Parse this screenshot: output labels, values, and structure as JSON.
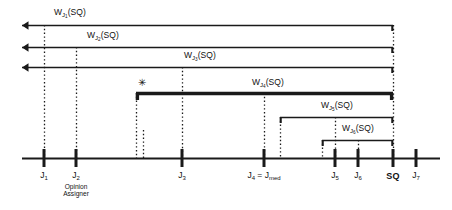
{
  "figure": {
    "type": "timeline-interval-diagram",
    "background": "#ffffff",
    "ink": "#1a1a1a",
    "axis": {
      "y": 158,
      "x_start": 22,
      "x_end": 440,
      "ticks": [
        {
          "id": "J1",
          "x": 44,
          "label": "J",
          "sub": "1",
          "sublabel": "",
          "bold": false
        },
        {
          "id": "J2",
          "x": 76,
          "label": "J",
          "sub": "2",
          "sublabel": "Opinion\nAssigner",
          "bold": false
        },
        {
          "id": "J3",
          "x": 182,
          "label": "J",
          "sub": "3",
          "sublabel": "",
          "bold": false
        },
        {
          "id": "J4",
          "x": 264,
          "label": "J",
          "sub": "4",
          "sublabel": "",
          "bold": false,
          "label_full": "J4 = Jmed"
        },
        {
          "id": "J5",
          "x": 335,
          "label": "J",
          "sub": "5",
          "sublabel": "",
          "bold": false
        },
        {
          "id": "J6",
          "x": 358,
          "label": "J",
          "sub": "6",
          "sublabel": "",
          "bold": false
        },
        {
          "id": "SQ",
          "x": 393,
          "label": "SQ",
          "sub": "",
          "sublabel": "",
          "bold": true
        },
        {
          "id": "J7",
          "x": 416,
          "label": "J",
          "sub": "7",
          "sublabel": "",
          "bold": false
        }
      ]
    },
    "tick_labels": {
      "J1": "J",
      "J1_sub": "1",
      "J2": "J",
      "J2_sub": "2",
      "J2_note_line1": "Opinion",
      "J2_note_line2": "Assigner",
      "J3": "J",
      "J3_sub": "3",
      "J4": "J",
      "J4_sub": "4",
      "J4_eq": " = J",
      "J4_med_sub": "med",
      "J5": "J",
      "J5_sub": "5",
      "J6": "J",
      "J6_sub": "6",
      "SQ": "SQ",
      "J7": "J",
      "J7_sub": "7"
    },
    "intervals": [
      {
        "id": "WJ1",
        "label_main": "W",
        "label_sub": "J",
        "label_subsub": "1",
        "label_tail": "(SQ)",
        "label_x": 70,
        "label_y": 8,
        "y": 25,
        "left_x": 22,
        "right_x": 393,
        "left_end": "arrow",
        "right_end": "bar",
        "thick": false,
        "anchor_x": 44,
        "star": false
      },
      {
        "id": "WJ2",
        "label_main": "W",
        "label_sub": "J",
        "label_subsub": "2",
        "label_tail": "(SQ)",
        "label_x": 103,
        "label_y": 31,
        "y": 47,
        "left_x": 22,
        "right_x": 393,
        "left_end": "arrow",
        "right_end": "bar",
        "thick": false,
        "anchor_x": 76,
        "star": false
      },
      {
        "id": "WJ3",
        "label_main": "W",
        "label_sub": "J",
        "label_subsub": "3",
        "label_tail": "(SQ)",
        "label_x": 200,
        "label_y": 51,
        "y": 67,
        "left_x": 22,
        "right_x": 393,
        "left_end": "arrow",
        "right_end": "bar",
        "thick": false,
        "anchor_x": 182,
        "star": false
      },
      {
        "id": "WJ4",
        "label_main": "W",
        "label_sub": "J",
        "label_subsub": "4",
        "label_tail": "(SQ)",
        "label_x": 268,
        "label_y": 78,
        "y": 93,
        "left_x": 136,
        "right_x": 393,
        "left_end": "bar",
        "right_end": "bar",
        "thick": true,
        "anchor_x": 264,
        "star": true,
        "star_x": 138,
        "star_y": 78
      },
      {
        "id": "WJ5",
        "label_main": "W",
        "label_sub": "J",
        "label_subsub": "5",
        "label_tail": "(SQ)",
        "label_x": 337,
        "label_y": 101,
        "y": 117,
        "left_x": 280,
        "right_x": 393,
        "left_end": "bar",
        "right_end": "bar",
        "thick": false,
        "anchor_x": 335,
        "star": false
      },
      {
        "id": "WJ6",
        "label_main": "W",
        "label_sub": "J",
        "label_subsub": "6",
        "label_tail": "(SQ)",
        "label_x": 358,
        "label_y": 124,
        "y": 140,
        "left_x": 322,
        "right_x": 393,
        "left_end": "bar",
        "right_end": "bar",
        "thick": false,
        "anchor_x": 358,
        "star": false
      }
    ],
    "dotted_verticals": [
      {
        "x": 44,
        "y_top": 25,
        "y_bottom": 158
      },
      {
        "x": 76,
        "y_top": 47,
        "y_bottom": 158
      },
      {
        "x": 136,
        "y_top": 93,
        "y_bottom": 158
      },
      {
        "x": 143,
        "y_top": 130,
        "y_bottom": 158
      },
      {
        "x": 182,
        "y_top": 67,
        "y_bottom": 158
      },
      {
        "x": 264,
        "y_top": 93,
        "y_bottom": 158
      },
      {
        "x": 280,
        "y_top": 117,
        "y_bottom": 158
      },
      {
        "x": 322,
        "y_top": 140,
        "y_bottom": 158
      },
      {
        "x": 335,
        "y_top": 117,
        "y_bottom": 158
      },
      {
        "x": 358,
        "y_top": 140,
        "y_bottom": 158
      },
      {
        "x": 393,
        "y_top": 25,
        "y_bottom": 158
      }
    ],
    "star_glyph": "✳"
  }
}
